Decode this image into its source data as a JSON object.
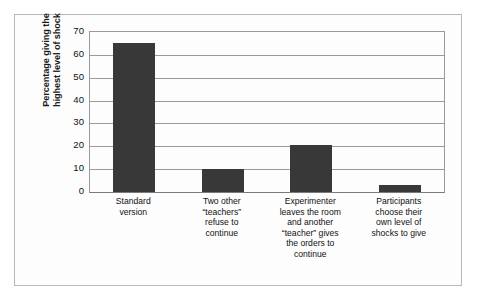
{
  "figure": {
    "border_color": "#b9b9b9",
    "background": "#fdfdfd"
  },
  "chart_data": {
    "type": "bar",
    "title": "",
    "subtitle": "",
    "xlabel": "",
    "ylabel": "Percentage giving the highest level of shock",
    "ylabel_lines": [
      "Percentage giving the",
      "highest level of shock"
    ],
    "ylim": [
      0,
      70
    ],
    "yticks": [
      0,
      10,
      20,
      30,
      40,
      50,
      60,
      70
    ],
    "ytick_labels": [
      "0",
      "10",
      "20",
      "30",
      "40",
      "50",
      "60",
      "70"
    ],
    "grid": true,
    "grid_axis": "y",
    "legend": false,
    "legend_position": "none",
    "bar_color": "#383838",
    "categories": [
      "Standard version",
      "Two other \"teachers\" refuse to continue",
      "Experimenter leaves the room and another \"teacher\" gives the orders to continue",
      "Participants choose their own level of shocks to give"
    ],
    "category_label_lines": [
      [
        "Standard",
        "version"
      ],
      [
        "Two other",
        "“teachers”",
        "refuse to",
        "continue"
      ],
      [
        "Experimenter",
        "leaves the room",
        "and another",
        "“teacher” gives",
        "the orders to",
        "continue"
      ],
      [
        "Participants",
        "choose their",
        "own level of",
        "shocks to give"
      ]
    ],
    "values": [
      65,
      10,
      20.5,
      3
    ]
  }
}
